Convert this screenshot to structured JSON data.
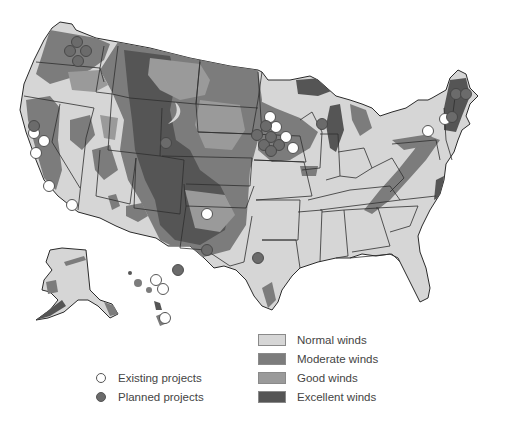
{
  "map": {
    "title": "U.S. wind resources and wind power projects",
    "colors": {
      "normal": "#d6d6d6",
      "moderate": "#7c7c7c",
      "good": "#9a9a9a",
      "excellent": "#555555",
      "existing_fill": "#ffffff",
      "planned_fill": "#6b6b6b",
      "border": "#2e2e2e"
    },
    "existing_projects": [
      {
        "x": 34,
        "y": 133
      },
      {
        "x": 44,
        "y": 141
      },
      {
        "x": 36,
        "y": 153
      },
      {
        "x": 49,
        "y": 186
      },
      {
        "x": 72,
        "y": 205
      },
      {
        "x": 270,
        "y": 117
      },
      {
        "x": 276,
        "y": 127
      },
      {
        "x": 286,
        "y": 137
      },
      {
        "x": 293,
        "y": 148
      },
      {
        "x": 445,
        "y": 119
      },
      {
        "x": 428,
        "y": 131
      },
      {
        "x": 207,
        "y": 214
      },
      {
        "x": 156,
        "y": 280
      },
      {
        "x": 163,
        "y": 289
      },
      {
        "x": 165,
        "y": 318
      }
    ],
    "planned_projects": [
      {
        "x": 77,
        "y": 42
      },
      {
        "x": 70,
        "y": 51
      },
      {
        "x": 86,
        "y": 51
      },
      {
        "x": 78,
        "y": 61
      },
      {
        "x": 34,
        "y": 126
      },
      {
        "x": 166,
        "y": 143
      },
      {
        "x": 257,
        "y": 135
      },
      {
        "x": 266,
        "y": 126
      },
      {
        "x": 264,
        "y": 145
      },
      {
        "x": 271,
        "y": 137
      },
      {
        "x": 279,
        "y": 145
      },
      {
        "x": 271,
        "y": 151
      },
      {
        "x": 322,
        "y": 124
      },
      {
        "x": 456,
        "y": 94
      },
      {
        "x": 466,
        "y": 94
      },
      {
        "x": 452,
        "y": 117
      },
      {
        "x": 207,
        "y": 250
      },
      {
        "x": 258,
        "y": 258
      },
      {
        "x": 178,
        "y": 270
      }
    ]
  },
  "legend": {
    "wind": [
      {
        "label": "Normal winds",
        "color": "#d6d6d6"
      },
      {
        "label": "Moderate winds",
        "color": "#7c7c7c"
      },
      {
        "label": "Good winds",
        "color": "#9a9a9a"
      },
      {
        "label": "Excellent winds",
        "color": "#555555"
      }
    ],
    "projects": [
      {
        "label": "Existing projects",
        "type": "existing"
      },
      {
        "label": "Planned projects",
        "type": "planned"
      }
    ]
  }
}
